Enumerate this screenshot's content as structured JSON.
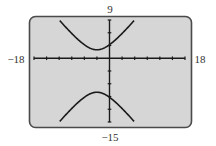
{
  "chart_data": {
    "type": "line",
    "title": "",
    "xlabel": "",
    "ylabel": "",
    "xlim": [
      -18,
      18
    ],
    "ylim": [
      -15,
      9
    ],
    "xscale": 3,
    "yscale": 3,
    "grid": false,
    "window_labels": {
      "xmin": "−18",
      "xmax": "18",
      "ymin": "−15",
      "ymax": "9"
    },
    "series": [
      {
        "name": "hyperbola",
        "equation": "(y+3)^2/25 - (x+3)^2/17 = 1",
        "center": [
          -3,
          -3
        ],
        "a": 5,
        "b_squared": 17,
        "branches": [
          "upper",
          "lower"
        ],
        "x_range": [
          -12.5,
          6.5
        ]
      }
    ],
    "colors": {
      "screen": "#d6d6d6",
      "frame": "#4a4a4a",
      "curve": "#1a1a1a",
      "axis": "#1a1a1a"
    }
  }
}
